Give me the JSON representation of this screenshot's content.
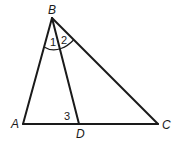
{
  "diagram": {
    "type": "geometry-triangle",
    "vertices": {
      "A": {
        "label": "A",
        "x": 23,
        "y": 124
      },
      "B": {
        "label": "B",
        "x": 52,
        "y": 18
      },
      "C": {
        "label": "C",
        "x": 158,
        "y": 124
      },
      "D": {
        "label": "D",
        "x": 79,
        "y": 124
      }
    },
    "segments": [
      "AB",
      "BC",
      "AC",
      "BD"
    ],
    "angles": [
      {
        "label": "1",
        "description": "angle ABD"
      },
      {
        "label": "2",
        "description": "angle DBC"
      },
      {
        "label": "3",
        "description": "angle BDA"
      }
    ],
    "colors": {
      "stroke": "#1a1a1a",
      "background": "#ffffff"
    }
  }
}
